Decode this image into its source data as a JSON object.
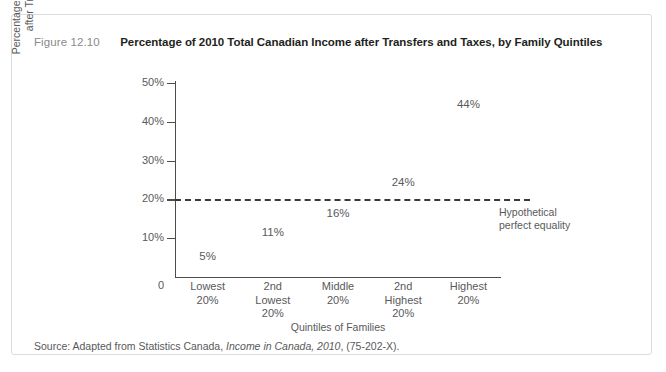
{
  "figure": {
    "number": "Figure 12.10",
    "title": "Percentage of 2010 Total Canadian Income after Transfers and Taxes, by Family Quintiles",
    "source_prefix": "Source: Adapted from Statistics Canada, ",
    "source_italic": "Income in Canada, 2010",
    "source_suffix": ", (75-202-X)."
  },
  "axes": {
    "origin_label": "0",
    "y_title_line1": "Percentage of Total Income Earned",
    "y_title_line2": "after Transfers and Taxes",
    "x_title": "Quintiles of Families",
    "y_ticks": [
      "10%",
      "20%",
      "30%",
      "40%",
      "50%"
    ]
  },
  "annotation": {
    "line1": "Hypothetical",
    "line2": "perfect equality",
    "reference_value": 20
  },
  "colors": {
    "text": "#58595b",
    "title": "#231f20",
    "figure_number": "#8a8a8a",
    "axis": "#4d4d4d",
    "dashed_line": "#3a3a3a",
    "card_border": "#dcdcdc",
    "background": "#ffffff"
  },
  "chart_data": {
    "type": "scatter",
    "title": "Percentage of 2010 Total Canadian Income after Transfers and Taxes, by Family Quintiles",
    "xlabel": "Quintiles of Families",
    "ylabel": "Percentage of Total Income Earned after Transfers and Taxes",
    "ylim": [
      0,
      50
    ],
    "yticks": [
      10,
      20,
      30,
      40,
      50
    ],
    "ytick_labels": [
      "10%",
      "20%",
      "30%",
      "40%",
      "50%"
    ],
    "grid": false,
    "legend": "none",
    "categories": [
      "Lowest 20%",
      "2nd Lowest 20%",
      "Middle 20%",
      "2nd Highest 20%",
      "Highest 20%"
    ],
    "category_lines": [
      [
        "Lowest",
        "20%"
      ],
      [
        "2nd",
        "Lowest",
        "20%"
      ],
      [
        "Middle",
        "20%"
      ],
      [
        "2nd",
        "Highest",
        "20%"
      ],
      [
        "Highest",
        "20%"
      ]
    ],
    "values": [
      5,
      11,
      16,
      24,
      44
    ],
    "data_labels": [
      "5%",
      "11%",
      "16%",
      "24%",
      "44%"
    ],
    "reference_line": {
      "value": 20,
      "label": "Hypothetical perfect equality",
      "style": "dashed"
    }
  }
}
